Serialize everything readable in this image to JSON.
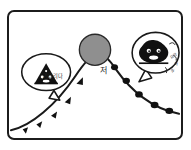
{
  "figure": {
    "frame": {
      "border_color": "#1c1c1c",
      "background_color": "#ffffff",
      "corner_radius": "7"
    },
    "peak_marker": {
      "label": "저",
      "fill_color": "#8f8f8f",
      "stroke_color": "#2a2a2a"
    },
    "bubbles": [
      {
        "id": "left-bubble",
        "text": "기다리다",
        "icon": "dark-mountain-face",
        "tail": "down-right"
      },
      {
        "id": "right-bubble",
        "text_lines": [
          "으악",
          "어",
          "아"
        ],
        "icon": "dark-creature-face",
        "tail": "down-left"
      }
    ],
    "curve": {
      "ascent_markers": "triangle",
      "descent_markers": "blob",
      "stroke_color": "#1a1a1a",
      "marker_fill": "#111111",
      "ascent_marker_count": 5,
      "descent_marker_count": 5
    }
  }
}
